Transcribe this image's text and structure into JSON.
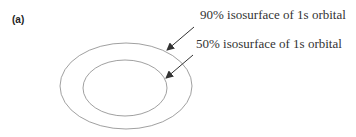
{
  "figure": {
    "panel_label": "(a)",
    "callouts": [
      {
        "text": "90% isosurface of 1s orbital"
      },
      {
        "text": "50% isosurface of 1s orbital"
      }
    ],
    "colors": {
      "stroke": "#888888",
      "arrow": "#333333",
      "text": "#333333"
    }
  }
}
